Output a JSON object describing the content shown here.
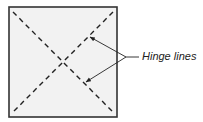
{
  "diagram": {
    "label": "Hinge lines",
    "colors": {
      "panel_fill": "#f2f2f2",
      "panel_border": "#333333",
      "lines": "#222222"
    }
  }
}
